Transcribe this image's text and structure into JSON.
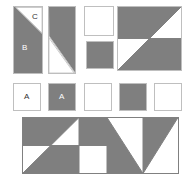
{
  "figure": {
    "background_color": "#ffffff",
    "fill_gray": "#7f7f7f",
    "fill_white": "#ffffff",
    "stroke_color": "#bfbfbf",
    "stroke_dark": "#808080",
    "label_dark_color": "#333333",
    "label_light_color": "#ffffff"
  },
  "labels": {
    "a_white": "A",
    "a_gray": "A",
    "b": "B",
    "c": "C"
  },
  "row1": {
    "name": "top-row-pieces",
    "pieces": [
      {
        "name": "piece-b-c",
        "description": "tall rectangle, gray body with white corner triangle C at top right",
        "label_main": "B",
        "label_corner": "C"
      },
      {
        "name": "piece-gray-with-bottom-white-triangle",
        "description": "tall rectangle, gray upper body with white triangle at bottom left"
      },
      {
        "name": "piece-white-square",
        "description": "plain white square"
      },
      {
        "name": "piece-gray-square-small",
        "description": "plain gray square"
      },
      {
        "name": "piece-large-pinwheel-square",
        "description": "large square with diagonal and midline, gray top-left and bottom-right"
      }
    ]
  },
  "row2": {
    "name": "middle-row-unit-squares",
    "squares": [
      {
        "name": "unit-square-white-a",
        "fill": "white",
        "label": "A"
      },
      {
        "name": "unit-square-gray-a",
        "fill": "gray",
        "label": "A"
      },
      {
        "name": "unit-square-white-1",
        "fill": "white",
        "label": ""
      },
      {
        "name": "unit-square-gray-1",
        "fill": "gray",
        "label": ""
      },
      {
        "name": "unit-square-white-2",
        "fill": "white",
        "label": ""
      }
    ]
  },
  "row3": {
    "name": "bottom-composite-strip",
    "description": "wide rectangle of four tiles: large pinwheel square, white square, and two half-diagonal squares",
    "tiles": [
      {
        "name": "tile-pinwheel-large",
        "description": "2x2 square, gray top-left and bottom-right halves split by rising diagonal and midline"
      },
      {
        "name": "tile-white-square",
        "description": "white square"
      },
      {
        "name": "tile-half-diagonal-left",
        "description": "square with falling diagonal, gray on lower-left"
      },
      {
        "name": "tile-half-diagonal-right",
        "description": "square with falling diagonal, gray on upper-left"
      }
    ]
  }
}
